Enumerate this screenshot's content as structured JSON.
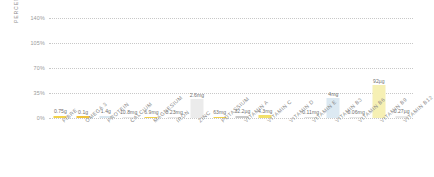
{
  "chart_data": {
    "type": "bar",
    "title": "",
    "xlabel": "",
    "ylabel": "PERCENTAGE OF RDA",
    "ylim": [
      0,
      140
    ],
    "grid": true,
    "legend": "none",
    "y_ticks": [
      "0%",
      "35%",
      "70%",
      "105%",
      "140%"
    ],
    "y_tick_values": [
      0,
      35,
      70,
      105,
      140
    ],
    "categories": [
      "FIBRE",
      "OMEGA 3",
      "PROTEIN",
      "CALCIUM",
      "MAGNESIUM",
      "IRON",
      "ZINC",
      "POTASSIUM",
      "VITAMIN A",
      "VITAMIN C",
      "VITAMIN D",
      "VITAMIN E",
      "VITAMIN B3",
      "VITAMIN B6",
      "VITAMIN B9",
      "VITAMIN B12"
    ],
    "data_labels": [
      "0.75g",
      "0.1g",
      "1.4g",
      "10.8mg",
      "6.9mg",
      "0.23mg",
      "2.6mg",
      "63mg",
      "32.2µg",
      "4.3mg",
      "",
      "0.11mg",
      "4mg",
      "0.06mg",
      "92µg",
      "0.27µg"
    ],
    "values": [
      3,
      2.5,
      3,
      1.5,
      2,
      1.5,
      26,
      2,
      3.5,
      4,
      0,
      1.5,
      28,
      2,
      46,
      3.5
    ],
    "bar_colors": [
      "#f2d24b",
      "#f0c33a",
      "#d8e6ef",
      "#e8e8e8",
      "#f2d24b",
      "#e8e8e8",
      "#ebebeb",
      "#f2d24b",
      "#c9c9c9",
      "#f2e06a",
      "#ffffff",
      "#e0e0e0",
      "#dce9f2",
      "#e8e8e8",
      "#f6f0b4",
      "#e8e8e8"
    ]
  },
  "colors": {
    "grid": "#c8c8c8",
    "tick_text": "#9a9a9a",
    "axis_title": "#8d8d8d",
    "category_text": "#8a8a8a",
    "value_text": "#6f6f6f",
    "background": "#ffffff"
  }
}
